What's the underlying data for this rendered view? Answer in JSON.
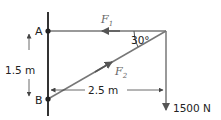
{
  "diagram": {
    "points": {
      "a": "A",
      "b": "B"
    },
    "forces": {
      "f1": {
        "symbol": "F",
        "subscript": "1"
      },
      "f2": {
        "symbol": "F",
        "subscript": "2"
      }
    },
    "angle_label": "30°",
    "dimensions": {
      "vertical": "1.5 m",
      "horizontal": "2.5 m"
    },
    "load_label": "1500 N",
    "colors": {
      "wall": "#333333",
      "member": "#666666",
      "text": "#222222"
    }
  }
}
